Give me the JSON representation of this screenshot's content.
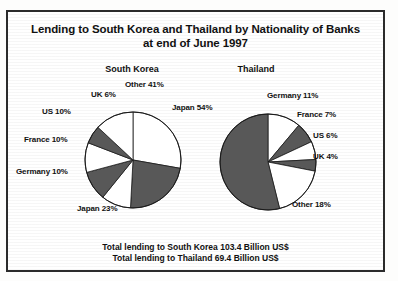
{
  "title": {
    "line1": "Lending to South Korea and Thailand by Nationality of Banks",
    "line2": "at end of June 1997"
  },
  "footer": {
    "line1": "Total lending to South Korea 103.4 Billion US$",
    "line2": "Total lending to Thailand 69.4 Billion US$"
  },
  "colors": {
    "dark": "#585858",
    "light": "#ffffff",
    "outline": "#1a1a1a",
    "text": "#111111",
    "border": "#2b2b2b"
  },
  "chart_data": [
    {
      "type": "pie",
      "title": "South Korea",
      "total_label": "Total lending to South Korea 103.4 Billion US$",
      "total_value": 103.4,
      "total_units": "Billion US$",
      "categories": [
        "Japan",
        "Other",
        "Japan 23",
        "Germany",
        "France",
        "US",
        "UK"
      ],
      "slices": [
        {
          "label": "Japan 54%",
          "name": "Japan",
          "value": 54,
          "fill": "light",
          "start_deg": 0,
          "end_deg": 100
        },
        {
          "label": "Japan 23%",
          "name": "Japan23",
          "value": 23,
          "fill": "dark",
          "start_deg": 100,
          "end_deg": 183
        },
        {
          "label": "Germany 10%",
          "name": "Germany",
          "value": 10,
          "fill": "light",
          "start_deg": 183,
          "end_deg": 219
        },
        {
          "label": "France 10%",
          "name": "France",
          "value": 10,
          "fill": "dark",
          "start_deg": 219,
          "end_deg": 255
        },
        {
          "label": "US 10%",
          "name": "US",
          "value": 10,
          "fill": "light",
          "start_deg": 255,
          "end_deg": 291
        },
        {
          "label": "UK 6%",
          "name": "UK",
          "value": 6,
          "fill": "dark",
          "start_deg": 291,
          "end_deg": 313
        },
        {
          "label": "Other 41%",
          "name": "Other",
          "value": 41,
          "fill": "light",
          "start_deg": 313,
          "end_deg": 360
        }
      ],
      "labels": [
        {
          "text": "Other 41%",
          "x": 123,
          "y": 78
        },
        {
          "text": "Japan 54%",
          "x": 170,
          "y": 101
        },
        {
          "text": "UK 6%",
          "x": 89,
          "y": 88
        },
        {
          "text": "US 10%",
          "x": 40,
          "y": 105
        },
        {
          "text": "France 10%",
          "x": 22,
          "y": 133
        },
        {
          "text": "Germany 10%",
          "x": 14,
          "y": 165
        },
        {
          "text": "Japan 23%",
          "x": 75,
          "y": 202
        }
      ]
    },
    {
      "type": "pie",
      "title": "Thailand",
      "total_label": "Total lending to Thailand 69.4 Billion US$",
      "total_value": 69.4,
      "total_units": "Billion US$",
      "categories": [
        "Germany",
        "France",
        "US",
        "UK",
        "Other",
        "Japan"
      ],
      "slices": [
        {
          "label": "Germany 11%",
          "name": "Germany",
          "value": 11,
          "fill": "light",
          "start_deg": 0,
          "end_deg": 40
        },
        {
          "label": "France 7%",
          "name": "France",
          "value": 7,
          "fill": "dark",
          "start_deg": 40,
          "end_deg": 65
        },
        {
          "label": "US 6%",
          "name": "US",
          "value": 6,
          "fill": "light",
          "start_deg": 65,
          "end_deg": 87
        },
        {
          "label": "UK 4%",
          "name": "UK",
          "value": 4,
          "fill": "dark",
          "start_deg": 87,
          "end_deg": 101
        },
        {
          "label": "Other 18%",
          "name": "Other",
          "value": 18,
          "fill": "light",
          "start_deg": 101,
          "end_deg": 166
        },
        {
          "label": "Japan 54%",
          "name": "Japan",
          "value": 54,
          "fill": "dark",
          "start_deg": 166,
          "end_deg": 360
        }
      ],
      "labels": [
        {
          "text": "Germany 11%",
          "x": 265,
          "y": 89
        },
        {
          "text": "France 7%",
          "x": 295,
          "y": 108
        },
        {
          "text": "US 6%",
          "x": 311,
          "y": 129
        },
        {
          "text": "UK 4%",
          "x": 311,
          "y": 150
        },
        {
          "text": "Other 18%",
          "x": 290,
          "y": 198
        }
      ]
    }
  ]
}
